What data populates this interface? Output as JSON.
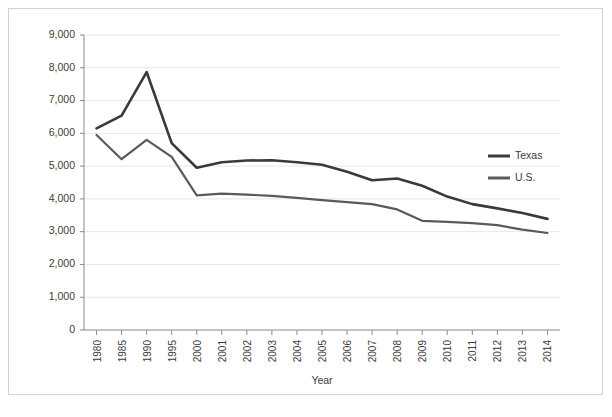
{
  "chart_data": {
    "type": "line",
    "title": "",
    "xlabel": "Year",
    "ylabel": "",
    "categories": [
      "1980",
      "1985",
      "1990",
      "1995",
      "2000",
      "2001",
      "2002",
      "2003",
      "2004",
      "2005",
      "2006",
      "2007",
      "2008",
      "2009",
      "2010",
      "2011",
      "2012",
      "2013",
      "2014"
    ],
    "ylim": [
      0,
      9000
    ],
    "ytick_values": [
      0,
      1000,
      2000,
      3000,
      4000,
      5000,
      6000,
      7000,
      8000,
      9000
    ],
    "ytick_labels": [
      "0",
      "1,000",
      "2,000",
      "3,000",
      "4,000",
      "5,000",
      "6,000",
      "7,000",
      "8,000",
      "9,000"
    ],
    "grid": true,
    "legend_position": "right",
    "series": [
      {
        "name": "Texas",
        "color": "#3a3a3a",
        "values": [
          6150,
          6540,
          7870,
          5700,
          4950,
          5120,
          5170,
          5180,
          5120,
          5040,
          4830,
          4570,
          4620,
          4400,
          4070,
          3840,
          3710,
          3570,
          3390
        ]
      },
      {
        "name": "U.S.",
        "color": "#5a5a5a",
        "values": [
          5950,
          5210,
          5800,
          5280,
          4110,
          4160,
          4130,
          4090,
          4030,
          3960,
          3900,
          3840,
          3680,
          3330,
          3300,
          3260,
          3200,
          3060,
          2960
        ]
      }
    ]
  },
  "legend": {
    "items": [
      {
        "label": "Texas"
      },
      {
        "label": "U.S."
      }
    ]
  },
  "axis": {
    "x_title": "Year"
  }
}
